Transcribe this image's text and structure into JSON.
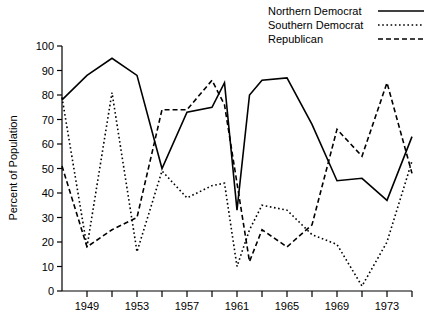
{
  "chart_data": {
    "type": "line",
    "title": "",
    "xlabel": "",
    "ylabel": "Percent of Population",
    "xlim": [
      1947,
      1975
    ],
    "ylim": [
      0,
      100
    ],
    "grid": false,
    "legend_position": "top-right",
    "x_ticks": [
      1949,
      1951,
      1953,
      1955,
      1957,
      1959,
      1961,
      1963,
      1965,
      1967,
      1969,
      1971,
      1973,
      1975
    ],
    "x_tick_labels": [
      "1949",
      "",
      "1953",
      "",
      "1957",
      "",
      "1961",
      "",
      "1965",
      "",
      "1969",
      "",
      "1973",
      ""
    ],
    "y_ticks": [
      0,
      10,
      20,
      30,
      40,
      50,
      60,
      70,
      80,
      90,
      100
    ],
    "y_tick_labels": [
      "0",
      "10",
      "20",
      "30",
      "40",
      "50",
      "60",
      "70",
      "80",
      "90",
      "100"
    ],
    "x": [
      1947,
      1949,
      1951,
      1953,
      1955,
      1957,
      1959,
      1960,
      1961,
      1962,
      1963,
      1965,
      1967,
      1969,
      1971,
      1973,
      1975
    ],
    "series": [
      {
        "name": "Northern Democrat",
        "style": "solid",
        "values": [
          78,
          88,
          95,
          88,
          50,
          73,
          75,
          85,
          33,
          80,
          86,
          87,
          68,
          45,
          46,
          37,
          63
        ]
      },
      {
        "name": "Southern Democrat",
        "style": "dotted",
        "values": [
          79,
          18,
          81,
          16,
          49,
          38,
          43,
          44,
          10,
          25,
          35,
          33,
          23,
          19,
          2,
          20,
          53
        ]
      },
      {
        "name": "Republican",
        "style": "dashed",
        "values": [
          51,
          18,
          25,
          30,
          74,
          74,
          86,
          76,
          44,
          12,
          25,
          18,
          27,
          66,
          55,
          85,
          48
        ]
      }
    ]
  },
  "legend": {
    "items": [
      {
        "label": "Northern Democrat",
        "style": "solid"
      },
      {
        "label": "Southern Democrat",
        "style": "dotted"
      },
      {
        "label": "Republican",
        "style": "dashed"
      }
    ]
  },
  "colors": {
    "ink": "#000000",
    "background": "#ffffff"
  }
}
